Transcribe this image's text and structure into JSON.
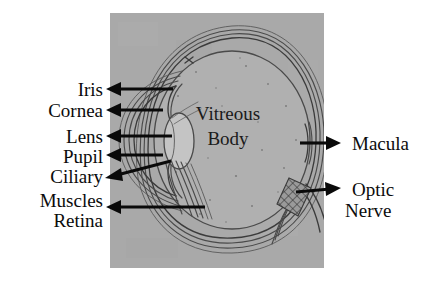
{
  "figure": {
    "panel": {
      "background_color": "#a9a9a9",
      "x": 110,
      "y": 13,
      "width": 214,
      "height": 255
    },
    "globe": {
      "fill_color": "#b0b0b0",
      "outline_color": "#4a4a4a"
    },
    "lens": {
      "fill_color": "#c4c4c4"
    }
  },
  "labels": {
    "left": [
      {
        "id": "iris",
        "text": "Iris",
        "x": 103,
        "y": 96,
        "arrow_from_x": 108,
        "arrow_from_y": 89,
        "arrow_to_x": 173,
        "arrow_to_y": 89
      },
      {
        "id": "cornea",
        "text": "Cornea",
        "x": 103,
        "y": 116,
        "arrow_from_x": 108,
        "arrow_from_y": 110,
        "arrow_to_x": 163,
        "arrow_to_y": 110
      },
      {
        "id": "lens",
        "text": "Lens",
        "x": 103,
        "y": 142,
        "arrow_from_x": 108,
        "arrow_from_y": 136,
        "arrow_to_x": 172,
        "arrow_to_y": 136
      },
      {
        "id": "pupil",
        "text": "Pupil",
        "x": 103,
        "y": 162,
        "arrow_from_x": 108,
        "arrow_from_y": 155,
        "arrow_to_x": 163,
        "arrow_to_y": 155
      },
      {
        "id": "ciliary",
        "text": "Ciliary",
        "x": 103,
        "y": 182,
        "arrow_from_x": 108,
        "arrow_from_y": 176,
        "arrow_to_x": 170,
        "arrow_to_y": 162
      },
      {
        "id": "muscles",
        "text": "Muscles",
        "x": 103,
        "y": 206,
        "arrow_from_x": 0,
        "arrow_from_y": 0,
        "arrow_to_x": 0,
        "arrow_to_y": 0
      },
      {
        "id": "retina",
        "text": "Retina",
        "x": 103,
        "y": 226,
        "arrow_from_x": 108,
        "arrow_from_y": 207,
        "arrow_to_x": 203,
        "arrow_to_y": 207
      }
    ],
    "right": [
      {
        "id": "macula",
        "text": "Macula",
        "x": 355,
        "y": 150,
        "arrow_from_x": 338,
        "arrow_from_y": 143,
        "arrow_to_x": 301,
        "arrow_to_y": 143
      },
      {
        "id": "optic-nerve-1",
        "text": "Optic",
        "x": 355,
        "y": 195,
        "arrow_from_x": 338,
        "arrow_from_y": 190,
        "arrow_to_x": 297,
        "arrow_to_y": 196
      },
      {
        "id": "optic-nerve-2",
        "text": "Nerve",
        "x": 355,
        "y": 215,
        "arrow_from_x": 0,
        "arrow_from_y": 0,
        "arrow_to_x": 0,
        "arrow_to_y": 0
      }
    ],
    "inner": [
      {
        "id": "vitreous-body-1",
        "text": "Vitreous",
        "x": 228,
        "y": 120
      },
      {
        "id": "vitreous-body-2",
        "text": "Body",
        "x": 228,
        "y": 145
      }
    ]
  }
}
